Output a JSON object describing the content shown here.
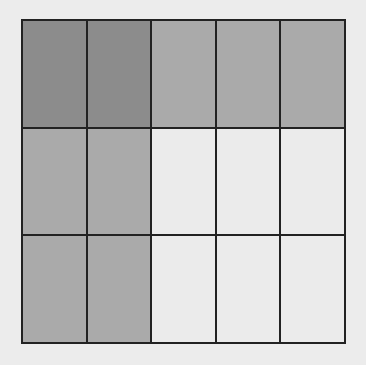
{
  "diagram": {
    "type": "fraction-grid",
    "rows": 3,
    "columns": 5,
    "colors": {
      "dark": "#8c8c8c",
      "medium": "#aaaaaa",
      "light": "#ebebeb",
      "border": "#222222",
      "background": "#ececec"
    },
    "cells": [
      [
        "dark",
        "dark",
        "medium",
        "medium",
        "medium"
      ],
      [
        "medium",
        "medium",
        "light",
        "light",
        "light"
      ],
      [
        "medium",
        "medium",
        "light",
        "light",
        "light"
      ]
    ],
    "counts": {
      "dark": 2,
      "medium": 7,
      "light": 6,
      "total": 15
    }
  }
}
